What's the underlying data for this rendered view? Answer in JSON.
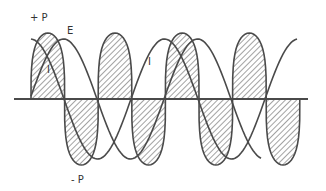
{
  "diagram": {
    "title": "",
    "labels": {
      "plus_p": "+ P",
      "minus_p": "- P",
      "e": "E",
      "i1": "I",
      "i2": "I"
    },
    "colors": {
      "stroke": "#4a4a4a",
      "hatch": "#555555",
      "background": "#ffffff"
    },
    "axis": {
      "x_start": 14,
      "x_end": 308,
      "y": 99
    },
    "power": {
      "x0": 31,
      "half_period": 33.6,
      "lobes": 8,
      "amplitude": 66
    },
    "voltage": {
      "x_start": 31,
      "x_end": 262,
      "zero": 97,
      "period": 134,
      "amplitude": 60
    },
    "current": {
      "x_start": 31,
      "x_end": 298,
      "zero": 64,
      "period": 134,
      "amplitude": 60
    }
  },
  "chart_data": {
    "type": "line",
    "title": "",
    "series": [
      {
        "name": "E",
        "description": "voltage sine wave"
      },
      {
        "name": "I",
        "description": "current sine wave, lagging E by ~90°"
      },
      {
        "name": "P",
        "description": "instantaneous power (hatched), double frequency, alternating +P / -P"
      }
    ],
    "annotations": [
      "+ P",
      "- P",
      "E",
      "I",
      "I"
    ],
    "grid": false
  }
}
